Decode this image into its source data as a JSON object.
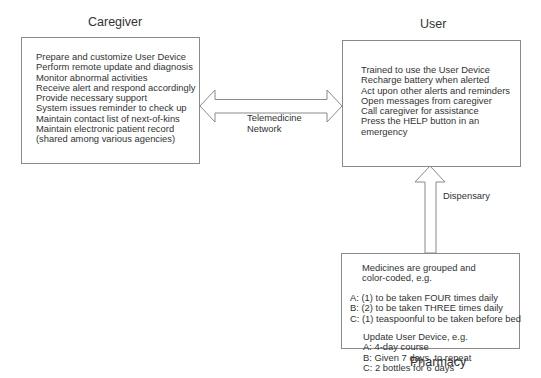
{
  "caregiver": {
    "title": "Caregiver",
    "items": [
      "Prepare and customize User Device",
      "Perform remote update and diagnosis",
      "Monitor abnormal activities",
      "Receive alert and respond accordingly",
      "Provide necessary support",
      "System issues reminder to check up",
      "Maintain contact list of next-of-kins",
      "Maintain electronic patient record",
      "(shared among various agencies)"
    ]
  },
  "user": {
    "title": "User",
    "items": [
      "Trained to use the User Device",
      "Recharge battery when alerted",
      "Act upon other alerts and reminders",
      "Open messages from caregiver",
      "Call caregiver for assistance",
      "Press the HELP button in an",
      "emergency"
    ]
  },
  "pharmacy": {
    "title": "Pharmacy",
    "intro": [
      "Medicines are grouped and",
      "color-coded, e.g."
    ],
    "medicines": [
      "A: (1) to be taken FOUR times daily",
      "B: (2) to be taken THREE times daily",
      "C: (1) teaspoonful to be taken before bed"
    ],
    "update_title": "Update User Device, e.g.",
    "updates": [
      "A: 4-day course",
      "B: Given 7 days, to repeat",
      "C: 2 bottles for 6 days"
    ]
  },
  "connections": {
    "telemedicine": [
      "Telemedicine",
      "Network"
    ],
    "dispensary": "Dispensary"
  },
  "colors": {
    "stroke": "#8a8a8a",
    "text": "#333333",
    "background": "#ffffff"
  }
}
